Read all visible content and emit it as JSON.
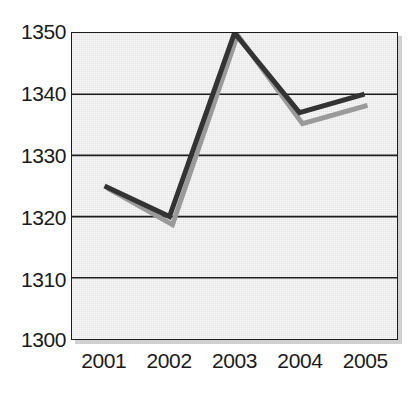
{
  "chart_data": {
    "type": "line",
    "title": "",
    "xlabel": "",
    "ylabel": "",
    "categories": [
      "2001",
      "2002",
      "2003",
      "2004",
      "2005"
    ],
    "ylim": [
      1300,
      1350
    ],
    "yticks": [
      1300,
      1310,
      1320,
      1330,
      1340,
      1350
    ],
    "ytick_labels": [
      "1300",
      "1310",
      "1320",
      "1330",
      "1340",
      "1350"
    ],
    "grid": true,
    "grid_axis": "y",
    "legend": "none",
    "series": [
      {
        "name": "dark-series",
        "color": "#333333",
        "values": [
          1325,
          1320,
          1350,
          1337,
          1340
        ]
      },
      {
        "name": "gray-series",
        "color": "#9a9a9a",
        "values": [
          1325,
          1319,
          1350,
          1335.5,
          1338.5
        ]
      }
    ]
  },
  "axes": {
    "y_labels": [
      "1350",
      "1340",
      "1330",
      "1320",
      "1310",
      "1300"
    ],
    "x_labels": [
      "2001",
      "2002",
      "2003",
      "2004",
      "2005"
    ]
  },
  "colors": {
    "plot_background": "#e3e3e3",
    "plot_border": "#1c1c1c",
    "gridline": "#1c1c1c",
    "dark_line": "#333333",
    "gray_line": "#9a9a9a",
    "tick_text": "#1a1a1a",
    "page_background": "#ffffff"
  }
}
